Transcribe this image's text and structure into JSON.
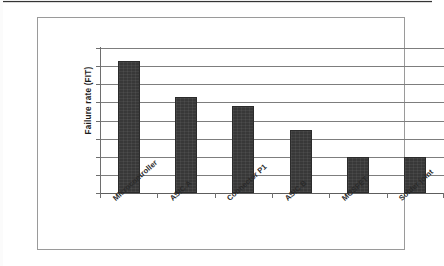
{
  "figure": {
    "y_axis_title": "Failure rate (FIT)"
  },
  "chart_data": {
    "type": "bar",
    "title": "",
    "subtitle": "",
    "xlabel": "",
    "ylabel": "Failure rate (FIT)",
    "categories": [
      "Microcontroller",
      "ASIC A",
      "Connector P1",
      "ASIC B",
      "MOSFET",
      "Solder joint"
    ],
    "values": [
      7.3,
      5.3,
      4.8,
      3.5,
      2.0,
      2.0
    ],
    "ylim": [
      0,
      8
    ],
    "y_tick_values": [
      0,
      1,
      2,
      3,
      4,
      5,
      6,
      7,
      8
    ],
    "y_tick_labels": [],
    "grid": true,
    "grid_axis": "y",
    "legend": false,
    "legend_position": "none",
    "bar_color": "#383838",
    "gridline_color": "#7d7d7d",
    "axis_color": "#6e6e6e",
    "background": "#ffffff",
    "x_tick_label_rotation": -42,
    "annotations": []
  }
}
